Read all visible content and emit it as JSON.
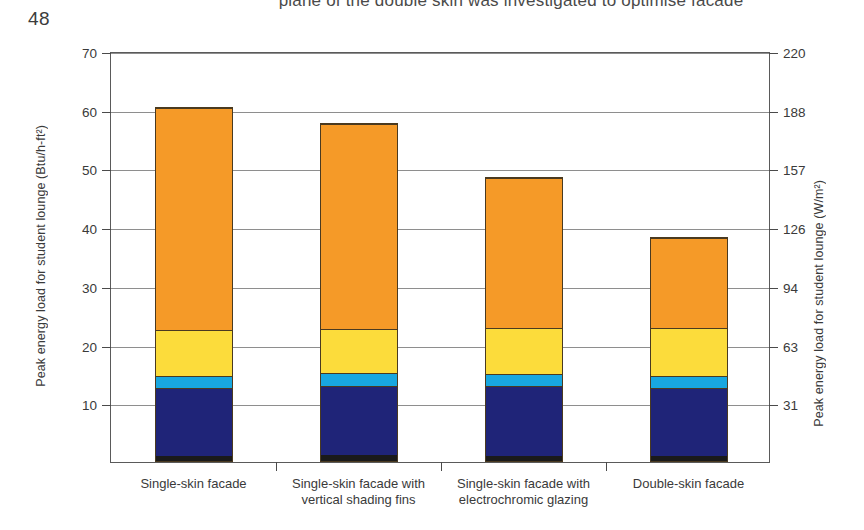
{
  "page": {
    "number": "48",
    "running_text": "plane of the double skin was investigated to optimise facade"
  },
  "chart_data": {
    "type": "bar",
    "stacked": true,
    "title": "",
    "xlabel": "",
    "ylabel": "Peak energy load for student lounge (Btu/h-ft²)",
    "ylabel_secondary": "Peak energy load for student lounge (W/m²)",
    "ylim": [
      0,
      70
    ],
    "grid": true,
    "legend": "none",
    "categories": [
      "Single-skin facade",
      "Single-skin facade with vertical shading fins",
      "Single-skin facade with electrochromic glazing",
      "Double-skin facade"
    ],
    "yticks_left": [
      70,
      60,
      50,
      40,
      30,
      20,
      10
    ],
    "ytick_labels_left": [
      "70",
      "60",
      "50",
      "40",
      "30",
      "20",
      "10"
    ],
    "yticks_right_positions": [
      70,
      60,
      50,
      40,
      30,
      20,
      10
    ],
    "ytick_labels_right": [
      "220",
      "188",
      "157",
      "126",
      "94",
      "63",
      "31"
    ],
    "series": [
      {
        "name": "segment-1",
        "color": "#1a1a1a",
        "values": [
          0.9,
          1.0,
          0.9,
          0.9
        ]
      },
      {
        "name": "segment-2",
        "color": "#1f2478",
        "values": [
          11.6,
          11.9,
          11.9,
          11.6
        ]
      },
      {
        "name": "segment-3",
        "color": "#18a7e0",
        "values": [
          2.0,
          2.2,
          2.2,
          2.1
        ]
      },
      {
        "name": "segment-4",
        "color": "#fcdc3b",
        "values": [
          7.9,
          7.6,
          7.8,
          8.2
        ]
      },
      {
        "name": "segment-5",
        "color": "#f59a28",
        "values": [
          38.1,
          35.0,
          25.7,
          15.6
        ]
      }
    ],
    "totals": [
      60.5,
      57.7,
      48.5,
      38.4
    ]
  }
}
